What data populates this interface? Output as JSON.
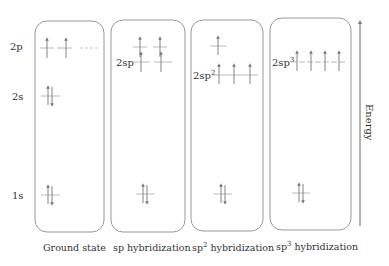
{
  "diagram": {
    "axis": {
      "label": "Energy",
      "direction": "up"
    },
    "panels": [
      {
        "id": "ground",
        "caption": "Ground state",
        "caption_base": "Ground state",
        "caption_sup": "",
        "caption_rest": "",
        "levels": [
          {
            "label": "2p",
            "sup": "",
            "electrons": [
              "up",
              "up",
              "empty"
            ]
          },
          {
            "label": "2s",
            "sup": "",
            "electrons": [
              "pair"
            ]
          },
          {
            "label": "1s",
            "sup": "",
            "electrons": [
              "pair"
            ]
          }
        ]
      },
      {
        "id": "sp",
        "caption": "sp hybridization",
        "caption_base": "sp",
        "caption_sup": "",
        "caption_rest": " hybridization",
        "levels": [
          {
            "label": "",
            "sup": "",
            "electrons": [
              "up",
              "up"
            ]
          },
          {
            "label": "2sp",
            "sup": "",
            "electrons": [
              "up",
              "up"
            ]
          },
          {
            "label": "",
            "sup": "",
            "electrons": [
              "pair"
            ]
          }
        ]
      },
      {
        "id": "sp2",
        "caption": "sp2 hybridization",
        "caption_base": "sp",
        "caption_sup": "2",
        "caption_rest": " hybridization",
        "levels": [
          {
            "label": "",
            "sup": "",
            "electrons": [
              "up"
            ]
          },
          {
            "label": "2sp",
            "sup": "2",
            "electrons": [
              "up",
              "up",
              "up"
            ]
          },
          {
            "label": "",
            "sup": "",
            "electrons": [
              "pair"
            ]
          }
        ]
      },
      {
        "id": "sp3",
        "caption": "sp3 hybridization",
        "caption_base": "sp",
        "caption_sup": "3",
        "caption_rest": " hybridization",
        "levels": [
          {
            "label": "2sp",
            "sup": "3",
            "electrons": [
              "up",
              "up",
              "up",
              "up"
            ]
          },
          {
            "label": "",
            "sup": "",
            "electrons": [
              "pair"
            ]
          }
        ]
      }
    ],
    "colors": {
      "line": "#888888",
      "text": "#333333",
      "box": "#999999"
    }
  }
}
